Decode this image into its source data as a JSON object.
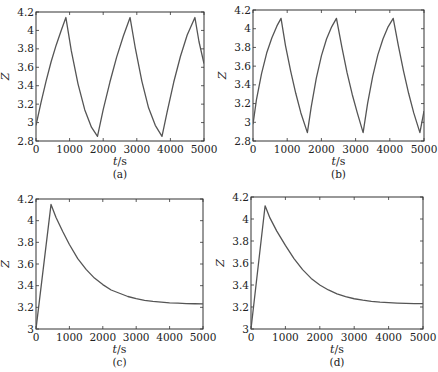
{
  "chart_data": [
    {
      "id": "a",
      "type": "line",
      "panel_label": "(a)",
      "xlabel_var": "t",
      "xlabel_unit": "/s",
      "ylabel": "Z",
      "xlim": [
        0,
        5000
      ],
      "ylim": [
        2.8,
        4.2
      ],
      "xticks": [
        0,
        1000,
        2000,
        3000,
        4000,
        5000
      ],
      "yticks": [
        2.8,
        3,
        3.2,
        3.4,
        3.6,
        3.8,
        4,
        4.2
      ],
      "ytick_labels": [
        "2.8",
        "3",
        "3.2",
        "3.4",
        "3.6",
        "3.8",
        "4",
        "4.2"
      ],
      "series": [
        {
          "name": "Z",
          "description": "periodic charge/discharge sawtooth",
          "x": [
            0,
            150,
            300,
            450,
            600,
            750,
            890,
            1050,
            1250,
            1450,
            1650,
            1830,
            2000,
            2200,
            2400,
            2600,
            2800,
            2950,
            3150,
            3350,
            3550,
            3750,
            3900,
            4100,
            4300,
            4500,
            4730,
            4850,
            5000
          ],
          "y": [
            2.97,
            3.22,
            3.45,
            3.66,
            3.84,
            4.0,
            4.14,
            3.78,
            3.42,
            3.14,
            2.95,
            2.85,
            3.14,
            3.44,
            3.71,
            3.94,
            4.14,
            3.82,
            3.45,
            3.16,
            2.97,
            2.85,
            3.11,
            3.44,
            3.72,
            3.95,
            4.14,
            3.88,
            3.64
          ]
        }
      ]
    },
    {
      "id": "b",
      "type": "line",
      "panel_label": "(b)",
      "xlabel_var": "t",
      "xlabel_unit": "/s",
      "ylabel": "Z",
      "xlim": [
        0,
        5000
      ],
      "ylim": [
        2.8,
        4.2
      ],
      "xticks": [
        0,
        1000,
        2000,
        3000,
        4000,
        5000
      ],
      "yticks": [
        2.8,
        3,
        3.2,
        3.4,
        3.6,
        3.8,
        4,
        4.2
      ],
      "ytick_labels": [
        "2.8",
        "3",
        "3.2",
        "3.4",
        "3.6",
        "3.8",
        "4",
        "4.2"
      ],
      "series": [
        {
          "name": "Z",
          "description": "periodic charge/discharge sawtooth, shorter period",
          "x": [
            0,
            100,
            250,
            400,
            550,
            700,
            820,
            950,
            1100,
            1250,
            1400,
            1590,
            1700,
            1850,
            2000,
            2150,
            2300,
            2440,
            2600,
            2750,
            2900,
            3050,
            3220,
            3350,
            3500,
            3650,
            3800,
            3950,
            4100,
            4250,
            4400,
            4550,
            4700,
            4880,
            5000
          ],
          "y": [
            2.98,
            3.24,
            3.52,
            3.74,
            3.9,
            4.03,
            4.11,
            3.82,
            3.55,
            3.31,
            3.1,
            2.89,
            3.16,
            3.47,
            3.71,
            3.89,
            4.02,
            4.11,
            3.8,
            3.53,
            3.3,
            3.1,
            2.89,
            3.2,
            3.49,
            3.72,
            3.89,
            4.02,
            4.11,
            3.82,
            3.55,
            3.31,
            3.1,
            2.89,
            3.12
          ]
        }
      ]
    },
    {
      "id": "c",
      "type": "line",
      "panel_label": "(c)",
      "xlabel_var": "t",
      "xlabel_unit": "/s",
      "ylabel": "Z",
      "xlim": [
        0,
        5000
      ],
      "ylim": [
        3.0,
        4.2
      ],
      "xticks": [
        0,
        1000,
        2000,
        3000,
        4000,
        5000
      ],
      "yticks": [
        3,
        3.2,
        3.4,
        3.6,
        3.8,
        4,
        4.2
      ],
      "ytick_labels": [
        "3",
        "3.2",
        "3.4",
        "3.6",
        "3.8",
        "4",
        "4.2"
      ],
      "series": [
        {
          "name": "Z",
          "description": "single charge then exponential relaxation",
          "x": [
            0,
            450,
            600,
            800,
            1000,
            1250,
            1500,
            1750,
            2000,
            2250,
            2500,
            2750,
            3000,
            3250,
            3500,
            3750,
            4000,
            4250,
            4500,
            4750,
            5000
          ],
          "y": [
            3.0,
            4.15,
            4.03,
            3.9,
            3.78,
            3.65,
            3.55,
            3.47,
            3.41,
            3.36,
            3.33,
            3.3,
            3.28,
            3.265,
            3.255,
            3.248,
            3.242,
            3.238,
            3.235,
            3.233,
            3.232
          ]
        }
      ]
    },
    {
      "id": "d",
      "type": "line",
      "panel_label": "(d)",
      "xlabel_var": "t",
      "xlabel_unit": "/s",
      "ylabel": "Z",
      "xlim": [
        0,
        5000
      ],
      "ylim": [
        3.0,
        4.2
      ],
      "xticks": [
        0,
        1000,
        2000,
        3000,
        4000,
        5000
      ],
      "yticks": [
        3,
        3.2,
        3.4,
        3.6,
        3.8,
        4,
        4.2
      ],
      "ytick_labels": [
        "3",
        "3.2",
        "3.4",
        "3.6",
        "3.8",
        "4",
        "4.2"
      ],
      "series": [
        {
          "name": "Z",
          "description": "single charge then exponential relaxation",
          "x": [
            0,
            410,
            550,
            750,
            1000,
            1250,
            1500,
            1750,
            2000,
            2250,
            2500,
            2750,
            3000,
            3250,
            3500,
            3750,
            4000,
            4250,
            4500,
            4750,
            5000
          ],
          "y": [
            3.0,
            4.12,
            4.01,
            3.89,
            3.76,
            3.64,
            3.54,
            3.46,
            3.4,
            3.355,
            3.32,
            3.295,
            3.275,
            3.262,
            3.252,
            3.245,
            3.24,
            3.236,
            3.233,
            3.231,
            3.23
          ]
        }
      ]
    }
  ]
}
